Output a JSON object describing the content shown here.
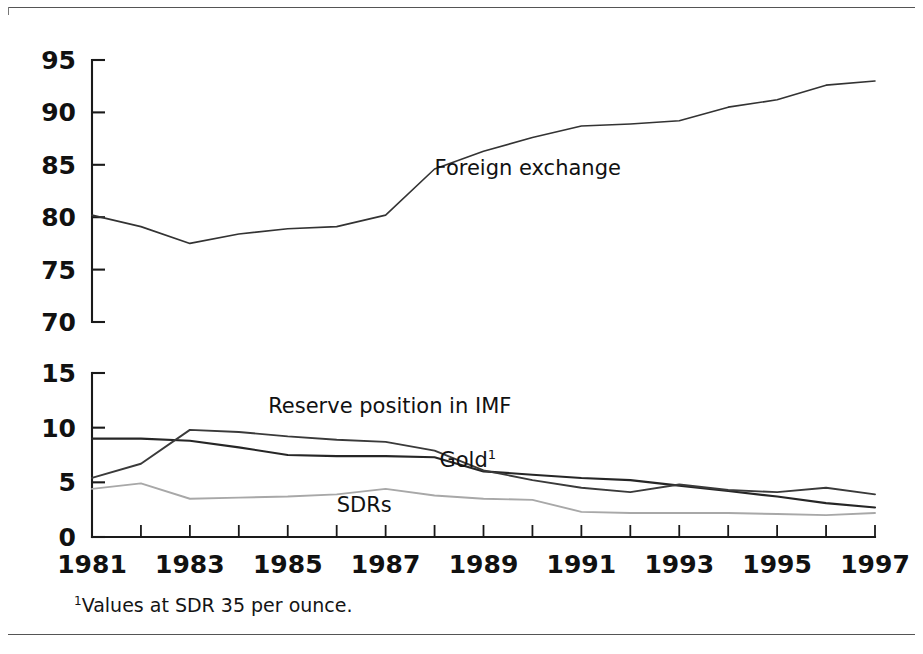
{
  "figure": {
    "footnote_marker": "1",
    "footnote_text": "Values at SDR 35 per ounce.",
    "line_color": "#1a1a1a",
    "background": "#ffffff"
  },
  "chart_data": [
    {
      "id": "top-panel",
      "type": "line",
      "title": "",
      "xlabel": "",
      "ylabel": "",
      "x": [
        1981,
        1982,
        1983,
        1984,
        1985,
        1986,
        1987,
        1988,
        1989,
        1990,
        1991,
        1992,
        1993,
        1994,
        1995,
        1996,
        1997
      ],
      "xlim": [
        1981,
        1997
      ],
      "ylim": [
        70,
        95
      ],
      "yticks": [
        70,
        75,
        80,
        85,
        90,
        95
      ],
      "xticks": [
        1981,
        1983,
        1985,
        1987,
        1989,
        1991,
        1993,
        1995,
        1997
      ],
      "xtick_labels": [
        "1981",
        "1983",
        "1985",
        "1987",
        "1989",
        "1991",
        "1993",
        "1995",
        "1997"
      ],
      "ytick_labels": [
        "70",
        "75",
        "80",
        "85",
        "90",
        "95"
      ],
      "grid": false,
      "legend": "inline-annotation",
      "series": [
        {
          "name": "Foreign exchange",
          "color": "#333333",
          "width": 1.6,
          "label_x": 1988.0,
          "label_y": 84.0,
          "values": [
            80.2,
            79.1,
            77.5,
            78.4,
            78.9,
            79.1,
            80.2,
            84.6,
            86.3,
            87.6,
            88.7,
            88.9,
            89.2,
            90.5,
            91.2,
            92.6,
            93.0
          ]
        }
      ]
    },
    {
      "id": "bottom-panel",
      "type": "line",
      "title": "",
      "xlabel": "",
      "ylabel": "",
      "x": [
        1981,
        1982,
        1983,
        1984,
        1985,
        1986,
        1987,
        1988,
        1989,
        1990,
        1991,
        1992,
        1993,
        1994,
        1995,
        1996,
        1997
      ],
      "xlim": [
        1981,
        1997
      ],
      "ylim": [
        0,
        15
      ],
      "yticks": [
        0,
        5,
        10,
        15
      ],
      "xticks": [
        1981,
        1983,
        1985,
        1987,
        1989,
        1991,
        1993,
        1995,
        1997
      ],
      "xtick_labels": [
        "1981",
        "1983",
        "1985",
        "1987",
        "1989",
        "1991",
        "1993",
        "1995",
        "1997"
      ],
      "ytick_labels": [
        "0",
        "5",
        "10",
        "15"
      ],
      "grid": false,
      "legend": "inline-annotation",
      "series": [
        {
          "name": "Gold",
          "superscript": "1",
          "color": "#262626",
          "width": 2.1,
          "label_x": 1988.1,
          "label_y": 6.4,
          "values": [
            9.0,
            9.0,
            8.8,
            8.2,
            7.5,
            7.4,
            7.4,
            7.3,
            6.0,
            5.7,
            5.4,
            5.2,
            4.7,
            4.2,
            3.7,
            3.1,
            2.7
          ]
        },
        {
          "name": "Reserve position in IMF",
          "color": "#3a3a3a",
          "width": 1.9,
          "label_x": 1984.6,
          "label_y": 11.3,
          "values": [
            5.4,
            6.7,
            9.8,
            9.6,
            9.2,
            8.9,
            8.7,
            7.9,
            6.1,
            5.2,
            4.5,
            4.1,
            4.8,
            4.3,
            4.1,
            4.5,
            3.9,
            4.9
          ]
        },
        {
          "name": "SDRs",
          "color": "#a8a8a8",
          "width": 1.9,
          "label_x": 1986.0,
          "label_y": 2.3,
          "values": [
            4.4,
            4.9,
            3.5,
            3.6,
            3.7,
            3.9,
            4.4,
            3.8,
            3.5,
            3.4,
            2.3,
            2.2,
            2.2,
            2.2,
            2.1,
            2.0,
            2.2
          ]
        }
      ]
    }
  ]
}
